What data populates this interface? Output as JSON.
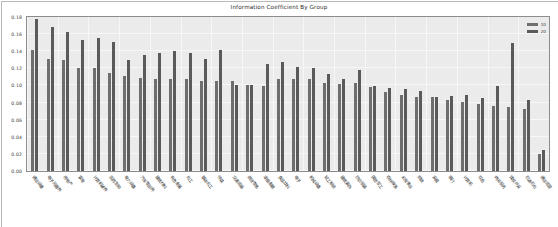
{
  "chart_data": {
    "type": "bar",
    "title": "Information Coefficient By Group",
    "xlabel": "",
    "ylabel": "",
    "ylim": [
      0.0,
      0.18
    ],
    "grid": true,
    "legend_position": "top-right",
    "ytick_labels": [
      "0.18",
      "0.16",
      "0.14",
      "0.12",
      "0.10",
      "0.08",
      "0.06",
      "0.04",
      "0.02",
      "0.00"
    ],
    "ytick_values": [
      0.18,
      0.16,
      0.14,
      0.12,
      0.1,
      0.08,
      0.06,
      0.04,
      0.02,
      0.0
    ],
    "categories": [
      "通信设备",
      "电子元器件",
      "房地产",
      "家电",
      "计算机硬件",
      "医药生物",
      "电力设备",
      "汽车零部件",
      "建筑材料",
      "有色金属",
      "化工",
      "基础化工",
      "传媒",
      "交通运输",
      "商贸零售",
      "非银金融",
      "食品饮料",
      "电子",
      "机械设备",
      "轻工制造",
      "建筑装饰",
      "纺织服装",
      "国防军工",
      "农林牧渔",
      "公用事业",
      "钢铁",
      "采掘",
      "银行",
      "计算机",
      "综合",
      "休闲服务",
      "煤炭开采",
      "石油石化",
      "通信运营"
    ],
    "series": [
      {
        "name": "10",
        "color": "#6e6e6e",
        "values": [
          0.142,
          0.131,
          0.13,
          0.12,
          0.12,
          0.114,
          0.111,
          0.109,
          0.108,
          0.108,
          0.107,
          0.105,
          0.105,
          0.105,
          0.1,
          0.099,
          0.108,
          0.108,
          0.107,
          0.103,
          0.102,
          0.103,
          0.098,
          0.092,
          0.089,
          0.087,
          0.086,
          0.083,
          0.081,
          0.078,
          0.076,
          0.075,
          0.072,
          0.02
        ]
      },
      {
        "name": "20",
        "color": "#5a5a5a",
        "values": [
          0.178,
          0.168,
          0.162,
          0.153,
          0.155,
          0.151,
          0.13,
          0.136,
          0.138,
          0.14,
          0.138,
          0.131,
          0.141,
          0.1,
          0.1,
          0.125,
          0.127,
          0.122,
          0.12,
          0.113,
          0.107,
          0.118,
          0.099,
          0.097,
          0.096,
          0.093,
          0.087,
          0.088,
          0.089,
          0.085,
          0.099,
          0.15,
          0.083,
          0.025
        ]
      }
    ]
  },
  "legend": {
    "entries": [
      {
        "label": "10"
      },
      {
        "label": "20"
      }
    ]
  }
}
